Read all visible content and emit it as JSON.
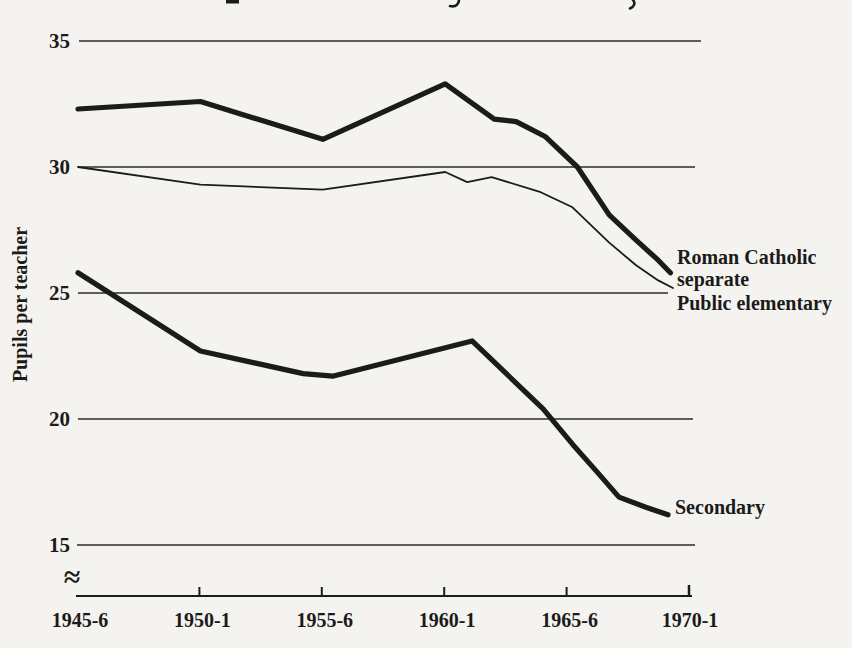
{
  "figure": {
    "background": "#f5f3ef",
    "ink": "#1b1b1b",
    "y_axis_title": "Pupils per teacher",
    "axis_break": "≈",
    "y_tick_labels": [
      "35",
      "30",
      "25",
      "20",
      "15"
    ],
    "y_tick_values": [
      35,
      30,
      25,
      20,
      15
    ],
    "x_tick_labels": [
      "1945-6",
      "1950-1",
      "1955-6",
      "1960-1",
      "1965-6",
      "1970-1"
    ],
    "series_labels": {
      "roman_catholic_line1": "Roman Catholic",
      "roman_catholic_line2": "separate",
      "public_elementary": "Public elementary",
      "secondary": "Secondary"
    }
  },
  "chart_data": {
    "type": "line",
    "title": "",
    "xlabel": "",
    "ylabel": "Pupils per teacher",
    "x_unit": "school years after 1945-6 (0 = 1945-6, 25 = 1970-1)",
    "x_tick_positions": [
      0,
      5,
      10,
      15,
      20,
      25
    ],
    "x_tick_labels": [
      "1945-6",
      "1950-1",
      "1955-6",
      "1960-1",
      "1965-6",
      "1970-1"
    ],
    "ylim": [
      15,
      35
    ],
    "y_gridlines": [
      15,
      20,
      25,
      30,
      35
    ],
    "axis_break_below": 15,
    "grid": "horizontal-only",
    "legend_position": "labels-at-line-ends",
    "series": [
      {
        "name": "Roman Catholic separate",
        "line_weight": "thick",
        "points": [
          [
            0,
            32.3
          ],
          [
            5,
            32.6
          ],
          [
            10,
            31.1
          ],
          [
            15,
            33.3
          ],
          [
            17,
            31.9
          ],
          [
            17.9,
            31.8
          ],
          [
            19.1,
            31.2
          ],
          [
            20.4,
            30.0
          ],
          [
            21.7,
            28.1
          ],
          [
            22.8,
            27.1
          ],
          [
            23.7,
            26.3
          ],
          [
            24.2,
            25.8
          ]
        ]
      },
      {
        "name": "Public elementary",
        "line_weight": "thin",
        "points": [
          [
            0,
            30.0
          ],
          [
            5,
            29.3
          ],
          [
            10,
            29.1
          ],
          [
            15,
            29.8
          ],
          [
            15.9,
            29.4
          ],
          [
            16.9,
            29.6
          ],
          [
            18.9,
            29.0
          ],
          [
            20.2,
            28.4
          ],
          [
            21.7,
            27.0
          ],
          [
            22.8,
            26.1
          ],
          [
            23.7,
            25.5
          ],
          [
            24.3,
            25.2
          ]
        ]
      },
      {
        "name": "Secondary",
        "line_weight": "thick",
        "points": [
          [
            0,
            25.8
          ],
          [
            5,
            22.7
          ],
          [
            9.2,
            21.8
          ],
          [
            10.4,
            21.7
          ],
          [
            16.1,
            23.1
          ],
          [
            19,
            20.4
          ],
          [
            20.2,
            19.0
          ],
          [
            21.2,
            17.9
          ],
          [
            22.1,
            16.9
          ],
          [
            23.2,
            16.5
          ],
          [
            24.1,
            16.2
          ]
        ]
      }
    ]
  }
}
